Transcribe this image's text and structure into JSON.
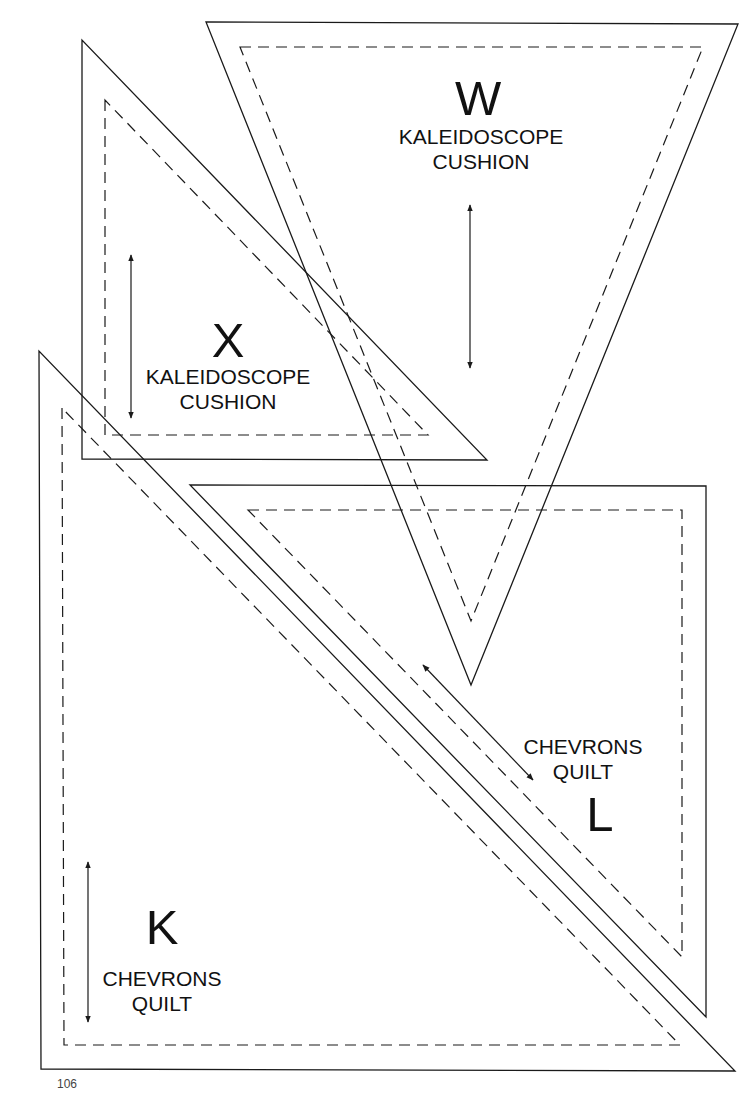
{
  "page": {
    "page_number": "106",
    "stroke_color": "#1a1a1a",
    "background": "#ffffff"
  },
  "templates": [
    {
      "id": "W",
      "letter": "W",
      "line1": "KALEIDOSCOPE",
      "line2": "CUSHION",
      "shape": "inverted-triangle",
      "outer": [
        [
          206,
          22
        ],
        [
          738,
          24
        ],
        [
          471,
          685
        ]
      ],
      "inner": [
        [
          240,
          47
        ],
        [
          703,
          47
        ],
        [
          471,
          621
        ]
      ],
      "grain_arrow": [
        [
          470,
          205
        ],
        [
          470,
          368
        ]
      ]
    },
    {
      "id": "X",
      "letter": "X",
      "line1": "KALEIDOSCOPE",
      "line2": "CUSHION",
      "shape": "right-triangle",
      "outer": [
        [
          82,
          40
        ],
        [
          82,
          459
        ],
        [
          487,
          460
        ]
      ],
      "inner": [
        [
          105,
          100
        ],
        [
          105,
          435
        ],
        [
          428,
          435
        ]
      ],
      "grain_arrow": [
        [
          131,
          255
        ],
        [
          131,
          418
        ]
      ]
    },
    {
      "id": "L",
      "letter": "L",
      "line1": "CHEVRONS",
      "line2": "QUILT",
      "shape": "right-triangle",
      "outer": [
        [
          190,
          485
        ],
        [
          706,
          486
        ],
        [
          706,
          1017
        ]
      ],
      "inner": [
        [
          248,
          510
        ],
        [
          682,
          510
        ],
        [
          682,
          957
        ]
      ],
      "grain_arrow": [
        [
          423,
          665
        ],
        [
          533,
          780
        ]
      ]
    },
    {
      "id": "K",
      "letter": "K",
      "line1": "CHEVRONS",
      "line2": "QUILT",
      "shape": "right-triangle",
      "outer": [
        [
          39,
          351
        ],
        [
          41,
          1069
        ],
        [
          735,
          1071
        ]
      ],
      "inner": [
        [
          62,
          408
        ],
        [
          64,
          1045
        ],
        [
          680,
          1045
        ]
      ],
      "grain_arrow": [
        [
          88,
          862
        ],
        [
          88,
          1022
        ]
      ]
    }
  ]
}
